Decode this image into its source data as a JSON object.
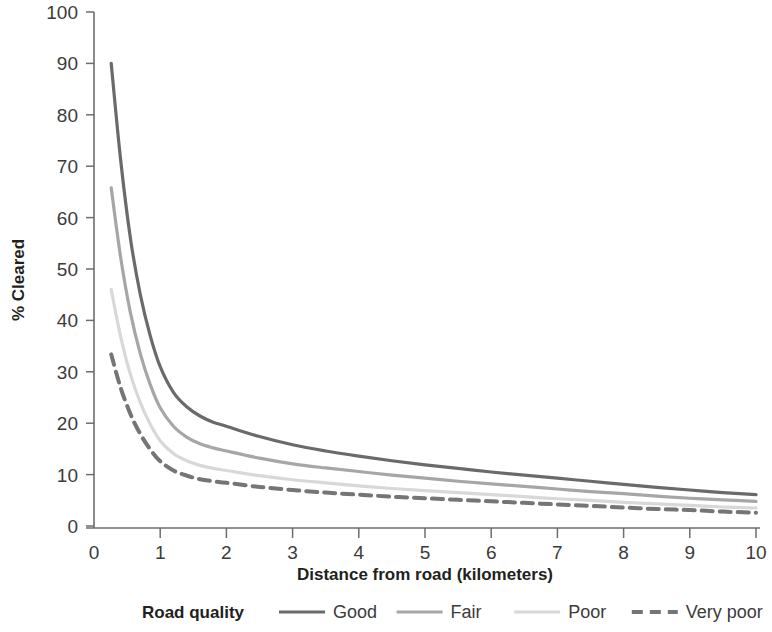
{
  "chart_data": {
    "type": "line",
    "title": "",
    "xlabel": "Distance from road (kilometers)",
    "ylabel": "% Cleared",
    "xlim": [
      0,
      10
    ],
    "ylim": [
      0,
      100
    ],
    "grid": false,
    "legend_position": "bottom",
    "legend_title": "Road quality",
    "x_ticks": [
      "0",
      "1",
      "2",
      "3",
      "4",
      "5",
      "6",
      "7",
      "8",
      "9",
      "10"
    ],
    "y_ticks": [
      "0",
      "10",
      "20",
      "30",
      "40",
      "50",
      "60",
      "70",
      "80",
      "90",
      "100"
    ],
    "x": [
      0.26,
      0.4,
      0.55,
      0.7,
      0.85,
      1.0,
      1.2,
      1.4,
      1.6,
      1.8,
      2.0,
      2.5,
      3.0,
      3.5,
      4.0,
      4.5,
      5.0,
      5.5,
      6.0,
      6.5,
      7.0,
      7.5,
      8.0,
      8.5,
      9.0,
      9.5,
      10.0
    ],
    "series": [
      {
        "name": "Good",
        "color": "#6a6a6a",
        "style": "solid",
        "width": 3.2,
        "values": [
          90.0,
          71.5,
          56.0,
          45.0,
          37.0,
          31.0,
          26.0,
          23.2,
          21.4,
          20.2,
          19.4,
          17.4,
          15.8,
          14.6,
          13.6,
          12.7,
          11.9,
          11.2,
          10.5,
          9.9,
          9.3,
          8.7,
          8.1,
          7.5,
          7.0,
          6.5,
          6.1
        ]
      },
      {
        "name": "Fair",
        "color": "#a6a6a6",
        "style": "solid",
        "width": 3.2,
        "values": [
          65.8,
          52.5,
          41.5,
          33.5,
          27.5,
          23.0,
          19.4,
          17.3,
          16.0,
          15.2,
          14.6,
          13.2,
          12.1,
          11.3,
          10.6,
          9.9,
          9.3,
          8.7,
          8.2,
          7.7,
          7.2,
          6.7,
          6.3,
          5.8,
          5.4,
          5.1,
          4.8
        ]
      },
      {
        "name": "Poor",
        "color": "#d8d8d8",
        "style": "solid",
        "width": 3.2,
        "values": [
          46.0,
          37.0,
          29.5,
          24.0,
          19.8,
          16.6,
          14.1,
          12.7,
          11.8,
          11.2,
          10.8,
          9.8,
          9.0,
          8.4,
          7.8,
          7.3,
          6.9,
          6.5,
          6.1,
          5.7,
          5.3,
          5.0,
          4.6,
          4.3,
          4.0,
          3.7,
          3.5
        ]
      },
      {
        "name": "Very poor",
        "color": "#757575",
        "style": "dashed",
        "width": 4.0,
        "values": [
          33.4,
          27.0,
          21.8,
          17.9,
          14.9,
          12.6,
          10.8,
          9.8,
          9.1,
          8.7,
          8.4,
          7.6,
          7.0,
          6.5,
          6.1,
          5.7,
          5.4,
          5.1,
          4.8,
          4.5,
          4.2,
          3.9,
          3.6,
          3.3,
          3.1,
          2.8,
          2.6
        ]
      }
    ]
  }
}
